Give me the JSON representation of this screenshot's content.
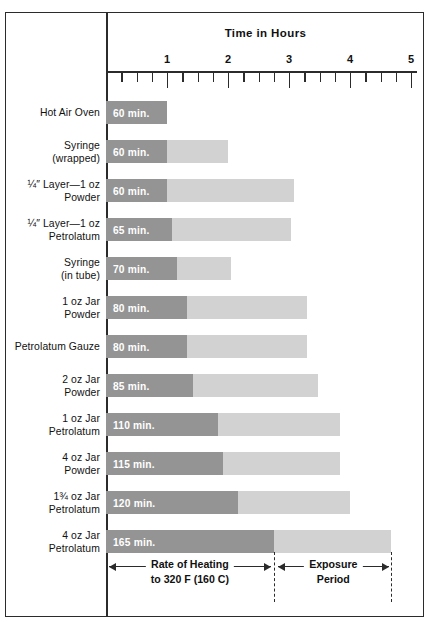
{
  "chart_data": {
    "type": "bar",
    "title": "Time in Hours",
    "xlabel": "Time in Hours",
    "ylabel": "",
    "xlim": [
      0,
      5.1
    ],
    "grid": false,
    "legend_position": "bottom",
    "orientation": "horizontal",
    "stacked": true,
    "tick_labels": [
      "1",
      "2",
      "3",
      "4",
      "5"
    ],
    "tick_values": [
      1,
      2,
      3,
      4,
      5
    ],
    "minor_tick_interval_hours": 0.25,
    "units": "hours",
    "series": [
      {
        "name": "Rate of Heating to 320 F (160 C)",
        "color": "#949494"
      },
      {
        "name": "Exposure Period",
        "color": "#d2d2d2"
      }
    ],
    "categories": [
      "Hot Air Oven",
      "Syringe (wrapped)",
      "1/4\" Layer—1 oz Powder",
      "1/4\" Layer—1 oz Petrolatum",
      "Syringe (in tube)",
      "1 oz Jar Powder",
      "Petrolatum Gauze",
      "2 oz Jar Powder",
      "1 oz Jar Petrolatum",
      "4 oz Jar Powder",
      "1 3/4 oz Jar Petrolatum",
      "4 oz Jar Petrolatum"
    ],
    "rows": [
      {
        "label_line1": "Hot Air Oven",
        "label_line2": "",
        "value_label": "60 min.",
        "heating_hours": 1.0,
        "exposure_hours": 0.0
      },
      {
        "label_line1": "Syringe",
        "label_line2": "(wrapped)",
        "value_label": "60 min.",
        "heating_hours": 1.0,
        "exposure_hours": 1.0
      },
      {
        "label_line1": "¼″ Layer—1 oz",
        "label_line2": "Powder",
        "value_label": "60 min.",
        "heating_hours": 1.0,
        "exposure_hours": 2.08
      },
      {
        "label_line1": "¼″ Layer—1 oz",
        "label_line2": "Petrolatum",
        "value_label": "65 min.",
        "heating_hours": 1.08,
        "exposure_hours": 1.95
      },
      {
        "label_line1": "Syringe",
        "label_line2": "(in tube)",
        "value_label": "70 min.",
        "heating_hours": 1.17,
        "exposure_hours": 0.88
      },
      {
        "label_line1": "1 oz Jar",
        "label_line2": "Powder",
        "value_label": "80 min.",
        "heating_hours": 1.33,
        "exposure_hours": 1.97
      },
      {
        "label_line1": "Petrolatum Gauze",
        "label_line2": "",
        "value_label": "80 min.",
        "heating_hours": 1.33,
        "exposure_hours": 1.97
      },
      {
        "label_line1": "2 oz Jar",
        "label_line2": "Powder",
        "value_label": "85 min.",
        "heating_hours": 1.42,
        "exposure_hours": 2.06
      },
      {
        "label_line1": "1 oz Jar",
        "label_line2": "Petrolatum",
        "value_label": "110 min.",
        "heating_hours": 1.83,
        "exposure_hours": 2.0
      },
      {
        "label_line1": "4 oz Jar",
        "label_line2": "Powder",
        "value_label": "115 min.",
        "heating_hours": 1.92,
        "exposure_hours": 1.92
      },
      {
        "label_line1": "1¾ oz Jar",
        "label_line2": "Petrolatum",
        "value_label": "120 min.",
        "heating_hours": 2.17,
        "exposure_hours": 1.83
      },
      {
        "label_line1": "4 oz Jar",
        "label_line2": "Petrolatum",
        "value_label": "165 min.",
        "heating_hours": 2.75,
        "exposure_hours": 1.92
      }
    ]
  },
  "legend": {
    "heating_line1": "Rate of Heating",
    "heating_line2": "to 320 F (160 C)",
    "exposure_line1": "Exposure",
    "exposure_line2": "Period",
    "heating_span_hours": [
      0,
      2.75
    ],
    "exposure_span_hours": [
      2.75,
      4.67
    ]
  },
  "colors": {
    "heating": "#949494",
    "exposure": "#d2d2d2",
    "ink": "#2b2b2b",
    "value_text": "#ffffff",
    "background": "#ffffff"
  }
}
